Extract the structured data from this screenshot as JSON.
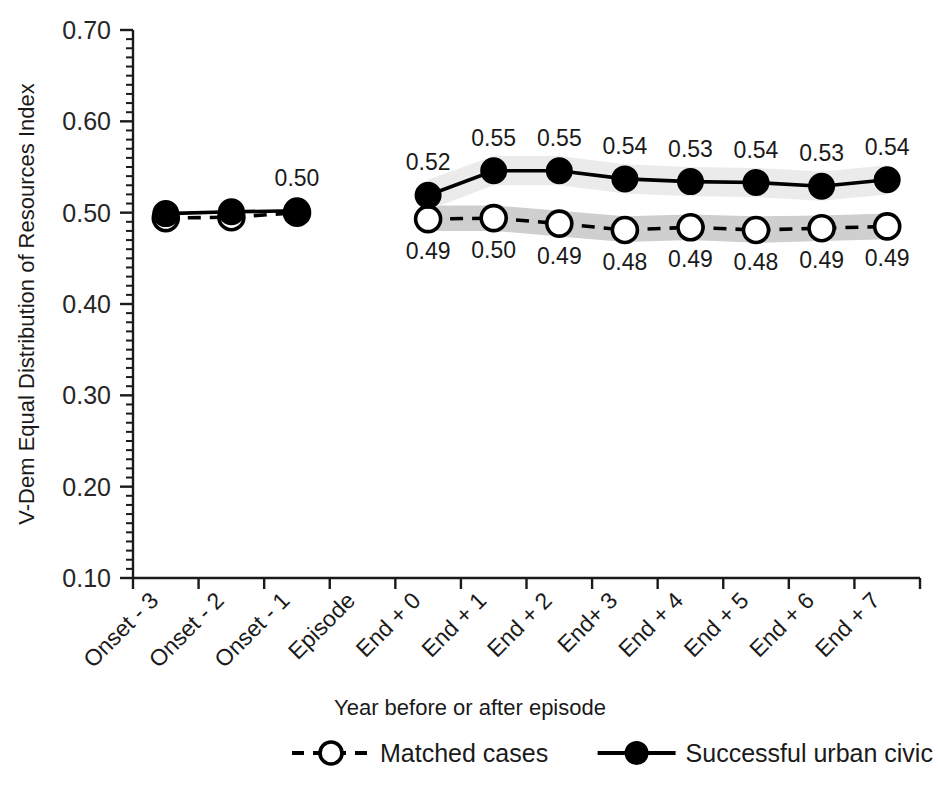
{
  "chart_data": {
    "type": "line",
    "title": "",
    "xlabel": "Year before or after episode",
    "ylabel": "V-Dem Equal Distribution of Resources Index",
    "ylim": [
      0.1,
      0.7
    ],
    "ytick_labels": [
      "0.70",
      "0.60",
      "0.50",
      "0.40",
      "0.30",
      "0.20",
      "0.10"
    ],
    "ytick_values": [
      0.7,
      0.6,
      0.5,
      0.4,
      0.3,
      0.2,
      0.1
    ],
    "minor_ticks": true,
    "grid": false,
    "legend_position": "bottom",
    "categories": [
      "Onset - 3",
      "Onset - 2",
      "Onset - 1",
      "Episode",
      "End + 0",
      "End + 1",
      "End + 2",
      "End+ 3",
      "End + 4",
      "End + 5",
      "End + 6",
      "End + 7"
    ],
    "series": [
      {
        "name": "Matched cases",
        "marker": "open-circle",
        "line_style": "dashed",
        "color": "#000000",
        "marker_fill": "#ffffff",
        "band_color": "#cfcfcf",
        "values": [
          0.494,
          0.495,
          0.5,
          null,
          0.493,
          0.494,
          0.488,
          0.481,
          0.484,
          0.481,
          0.483,
          0.485
        ],
        "labels": [
          null,
          null,
          null,
          null,
          "0.49",
          "0.50",
          "0.49",
          "0.48",
          "0.49",
          "0.48",
          "0.49",
          "0.49"
        ],
        "band_lower": [
          null,
          null,
          null,
          null,
          0.48,
          0.48,
          0.474,
          0.468,
          0.47,
          0.467,
          0.469,
          0.471
        ],
        "band_upper": [
          null,
          null,
          null,
          null,
          0.508,
          0.508,
          0.502,
          0.496,
          0.498,
          0.496,
          0.497,
          0.499
        ]
      },
      {
        "name": "Successful urban civic",
        "marker": "filled-circle",
        "line_style": "solid",
        "color": "#000000",
        "marker_fill": "#000000",
        "band_color": "#ebebeb",
        "values": [
          0.499,
          0.501,
          0.502,
          null,
          0.519,
          0.546,
          0.546,
          0.537,
          0.534,
          0.533,
          0.529,
          0.536
        ],
        "labels": [
          null,
          null,
          "0.50",
          null,
          "0.52",
          "0.55",
          "0.55",
          "0.54",
          "0.53",
          "0.54",
          "0.53",
          "0.54"
        ],
        "band_lower": [
          null,
          null,
          null,
          null,
          0.503,
          0.53,
          0.53,
          0.521,
          0.518,
          0.517,
          0.513,
          0.52
        ],
        "band_upper": [
          null,
          null,
          null,
          null,
          0.536,
          0.562,
          0.562,
          0.553,
          0.55,
          0.549,
          0.545,
          0.552
        ]
      }
    ]
  },
  "legend": {
    "items": [
      {
        "label": "Matched cases",
        "marker": "open-circle",
        "line_style": "dashed"
      },
      {
        "label": "Successful urban civic",
        "marker": "filled-circle",
        "line_style": "solid"
      }
    ]
  }
}
